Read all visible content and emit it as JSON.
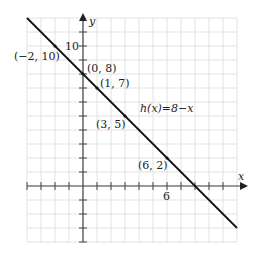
{
  "chart_data": {
    "type": "line",
    "title": "",
    "xlabel": "x",
    "ylabel": "y",
    "xlim": [
      -4,
      11
    ],
    "ylim": [
      -4,
      12
    ],
    "grid": true,
    "tick_labels": {
      "x": [
        "6"
      ],
      "y": [
        "10"
      ]
    },
    "series": [
      {
        "name": "h(x)=8−x",
        "function": "h(x) = 8 - x",
        "x": [
          -2,
          0,
          1,
          3,
          6
        ],
        "y": [
          10,
          8,
          7,
          5,
          2
        ]
      }
    ],
    "annotations": [
      {
        "text": "(−2, 10)",
        "x": -2,
        "y": 10
      },
      {
        "text": "(0, 8)",
        "x": 0,
        "y": 8
      },
      {
        "text": "(1, 7)",
        "x": 1,
        "y": 7
      },
      {
        "text": "(3, 5)",
        "x": 3,
        "y": 5
      },
      {
        "text": "(6, 2)",
        "x": 6,
        "y": 2
      },
      {
        "text": "h(x)=8−x",
        "x": 5.2,
        "y": 5.5
      }
    ]
  },
  "labels": {
    "x_axis": "x",
    "y_axis": "y",
    "x_tick_6": "6",
    "y_tick_10": "10",
    "pt_m2_10": "(−2, 10)",
    "pt_0_8": "(0, 8)",
    "pt_1_7": "(1, 7)",
    "pt_3_5": "(3, 5)",
    "pt_6_2": "(6, 2)",
    "func": "h(x)=8−x"
  },
  "colors": {
    "grid": "#e2e2e2",
    "axis": "#444444",
    "line": "#111111"
  }
}
